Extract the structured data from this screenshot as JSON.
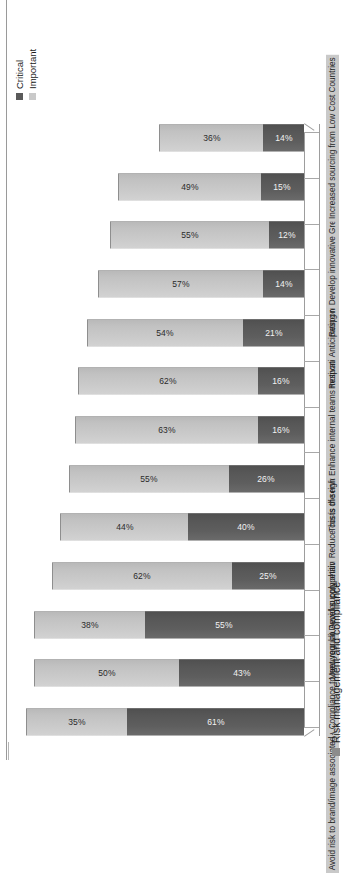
{
  "chart_data": {
    "type": "bar",
    "subtype": "stacked-bar-horizontalbars-rotated",
    "title": "",
    "xlabel": "",
    "ylabel": "",
    "ylim": [
      0,
      100
    ],
    "grid": false,
    "legend_position": "right",
    "categories": [
      "Avoid risk to brand/image associated with bad social/environmental practices of ...",
      "Compliance to new regulations",
      "Meet your clients expectations",
      "Avoid supply chain disruption",
      "Develop competitive advantage compared to competition",
      "Reduce costs of services/products procured",
      "This is the right thing to do for the planet and the society",
      "Enhance internal teams motivation and engagement",
      "Respond to investors' pressure",
      "Anticipating resources scarcity/depletion",
      "Respond to increased activism from NGOs/social media",
      "Develop innovative Green products in collaboration with suppliers",
      "Increased sourcing from Low Cost Countries"
    ],
    "category_shaded": [
      true,
      true,
      false,
      true,
      false,
      true,
      false,
      true,
      false,
      true,
      false,
      true,
      true
    ],
    "series": [
      {
        "name": "Critical",
        "color": "#5a5a5a",
        "values": [
          61,
          43,
          55,
          25,
          40,
          26,
          16,
          16,
          21,
          14,
          12,
          15,
          14
        ],
        "labels": [
          "61%",
          "43%",
          "55%",
          "25%",
          "40%",
          "26%",
          "16%",
          "16%",
          "21%",
          "14%",
          "12%",
          "15%",
          "14%"
        ]
      },
      {
        "name": "Important",
        "color": "#c9c9c9",
        "values": [
          35,
          50,
          38,
          62,
          44,
          55,
          63,
          62,
          54,
          57,
          55,
          49,
          36
        ],
        "labels": [
          "35%",
          "50%",
          "38%",
          "62%",
          "44%",
          "55%",
          "63%",
          "62%",
          "54%",
          "57%",
          "55%",
          "49%",
          "36%"
        ]
      }
    ],
    "totals": [
      96,
      93,
      93,
      87,
      84,
      81,
      79,
      78,
      75,
      71,
      67,
      64,
      50
    ]
  },
  "legend": {
    "title": "",
    "items": [
      {
        "label": "Critical",
        "color": "#5a5a5a"
      },
      {
        "label": "Important",
        "color": "#c9c9c9"
      }
    ]
  },
  "group_legend": {
    "items": [
      {
        "label": "Risk management and compliance",
        "color": "#8c8c8c"
      }
    ]
  }
}
